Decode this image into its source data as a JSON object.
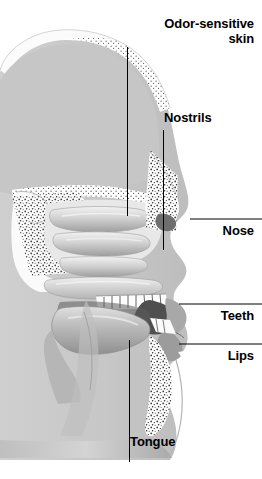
{
  "figure": {
    "width": 262,
    "height": 479,
    "background_color": "#ffffff"
  },
  "palette": {
    "background": "#ffffff",
    "tissue_light": "#c9c9c9",
    "tissue_mid": "#b0b0b0",
    "tissue_dark": "#8a8a8a",
    "cavity_dark": "#5a5a5a",
    "bone_white": "#fbfbfb",
    "stipple": "#2b2b2b",
    "label_text": "#000000",
    "leader_line": "#000000"
  },
  "labels": [
    {
      "id": "odor-sensitive-skin",
      "text": "Odor-sensitive\nskin",
      "align": "right",
      "leader": "vertical"
    },
    {
      "id": "nostrils",
      "text": "Nostrils",
      "align": "left",
      "leader": "vertical"
    },
    {
      "id": "nose",
      "text": "Nose",
      "align": "right",
      "leader": "horizontal"
    },
    {
      "id": "teeth",
      "text": "Teeth",
      "align": "right",
      "leader": "horizontal"
    },
    {
      "id": "lips",
      "text": "Lips",
      "align": "right",
      "leader": "horizontal"
    },
    {
      "id": "tongue",
      "text": "Tongue",
      "align": "left",
      "leader": "vertical"
    }
  ],
  "anatomy_parts": [
    "cranial-vault-bone",
    "brain-cavity",
    "frontal-sinus",
    "nasal-turbinates",
    "nasal-cavity",
    "nostril-opening",
    "hard-palate",
    "upper-teeth",
    "lower-teeth",
    "lips",
    "tongue",
    "oral-cavity",
    "jaw-bone",
    "throat",
    "neck"
  ]
}
